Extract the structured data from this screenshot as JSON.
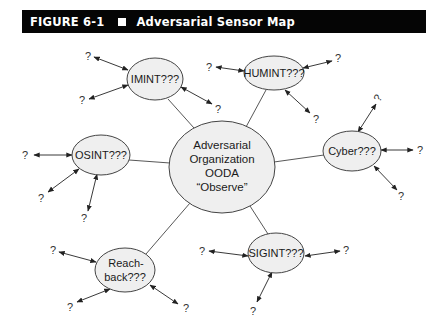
{
  "figure": {
    "number": "FIGURE 6-1",
    "title": "Adversarial Sensor Map",
    "header_bg": "#050505",
    "header_fg": "#ffffff"
  },
  "diagram": {
    "node_fill": "#efefef",
    "node_stroke": "#444444",
    "center": {
      "lines": [
        "Adversarial",
        "Organization",
        "OODA",
        "“Observe”"
      ]
    },
    "nodes": {
      "imint": {
        "label": "IMINT???"
      },
      "humint": {
        "label": "HUMINT???"
      },
      "osint": {
        "label": "OSINT???"
      },
      "cyber": {
        "label": "Cyber???"
      },
      "reachback_line1": "Reach-",
      "reachback_line2": "back???",
      "sigint": {
        "label": "SIGINT???"
      }
    },
    "unknown_marker": "?"
  }
}
